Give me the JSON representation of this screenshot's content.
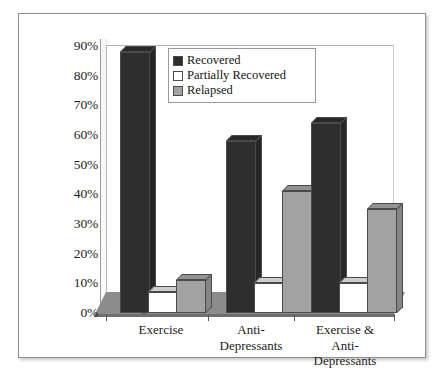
{
  "chart_data": {
    "type": "bar",
    "title": "",
    "subtitle": "",
    "xlabel": "",
    "ylabel": "",
    "grid": false,
    "legend_position": "top-center-inside",
    "style": "3d-clustered-column",
    "categories": [
      "Exercise",
      "Anti-Depressants",
      "Exercise & Anti-Depressants"
    ],
    "category_label_lines": [
      [
        "Exercise"
      ],
      [
        "Anti-",
        "Depressants"
      ],
      [
        "Exercise &",
        "Anti-",
        "Depressants"
      ]
    ],
    "series": [
      {
        "name": "Recovered",
        "color": "#2e2e2e",
        "values": [
          88,
          58,
          64
        ]
      },
      {
        "name": "Partially Recovered",
        "color": "#ffffff",
        "values": [
          7,
          10,
          10
        ]
      },
      {
        "name": "Relapsed",
        "color": "#a2a2a2",
        "values": [
          11,
          41,
          35
        ]
      }
    ],
    "ylim": [
      0,
      90
    ],
    "ytick_values": [
      0,
      10,
      20,
      30,
      40,
      50,
      60,
      70,
      80,
      90
    ],
    "ytick_labels": [
      "0%",
      "10%",
      "20%",
      "30%",
      "40%",
      "50%",
      "60%",
      "70%",
      "80%",
      "90%"
    ]
  },
  "legend": {
    "items": [
      {
        "label": "Recovered"
      },
      {
        "label": "Partially Recovered"
      },
      {
        "label": "Relapsed"
      }
    ]
  },
  "colors": {
    "recovered": "#2e2e2e",
    "partially_recovered": "#ffffff",
    "relapsed": "#a2a2a2",
    "floor": "#8c8c8c",
    "frame": "#8d8d8d",
    "text": "#1c1c1c"
  }
}
